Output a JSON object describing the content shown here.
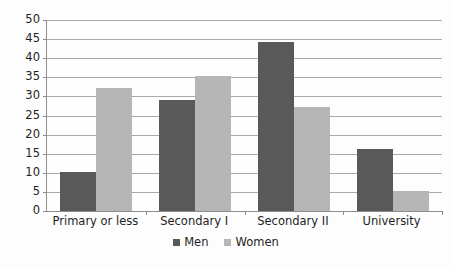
{
  "chart_data": {
    "type": "bar",
    "title": "",
    "subtitle": "",
    "xlabel": "",
    "ylabel": "",
    "categories": [
      "Primary or less",
      "Secondary I",
      "Secondary II",
      "University"
    ],
    "series": [
      {
        "name": "Men",
        "color": "#595959",
        "values": [
          10.3,
          29.0,
          44.2,
          16.2
        ]
      },
      {
        "name": "Women",
        "color": "#b6b6b6",
        "values": [
          32.1,
          35.3,
          27.3,
          5.2
        ]
      }
    ],
    "ylim": [
      0,
      50
    ],
    "ytick_values": [
      0,
      5,
      10,
      15,
      20,
      25,
      30,
      35,
      40,
      45,
      50
    ],
    "ytick_labels": [
      "0",
      "5",
      "10",
      "15",
      "20",
      "25",
      "30",
      "35",
      "40",
      "45",
      "50"
    ],
    "grid": true,
    "grid_axis": "y",
    "legend_position": "bottom",
    "legend_entries": [
      "Men",
      "Women"
    ],
    "background_color": "#ffffff",
    "gridline_color": "#a9a9a9",
    "axis_color": "#8d8d8d"
  }
}
